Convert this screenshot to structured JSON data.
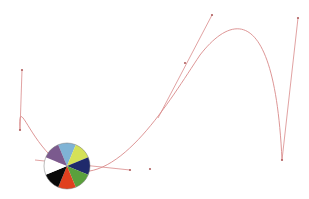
{
  "canvas": {
    "width": 309,
    "height": 199,
    "background": "#ffffff"
  },
  "curve": {
    "color": "#d98a8a",
    "path": "M 20 130 C 18 90, 30 150, 70 170 C 120 185, 170 100, 200 55 C 235 10, 275 10, 282 160",
    "handles": [
      {
        "x1": 22,
        "y1": 70,
        "x2": 20,
        "y2": 130
      },
      {
        "x1": 35,
        "y1": 160,
        "x2": 130,
        "y2": 170
      },
      {
        "x1": 158,
        "y1": 118,
        "x2": 212,
        "y2": 15
      },
      {
        "x1": 282,
        "y1": 160,
        "x2": 298,
        "y2": 18
      }
    ],
    "points": [
      {
        "x": 22,
        "y": 70
      },
      {
        "x": 20,
        "y": 130
      },
      {
        "x": 130,
        "y": 170
      },
      {
        "x": 212,
        "y": 15
      },
      {
        "x": 185,
        "y": 63
      },
      {
        "x": 282,
        "y": 160
      },
      {
        "x": 298,
        "y": 18
      },
      {
        "x": 150,
        "y": 169
      }
    ]
  },
  "color_wheel": {
    "cx": 67,
    "cy": 166,
    "r": 23,
    "slices": [
      {
        "name": "light-blue",
        "color": "#7fb3d5"
      },
      {
        "name": "yellow-green",
        "color": "#d4e157"
      },
      {
        "name": "navy",
        "color": "#1f2a6b"
      },
      {
        "name": "green",
        "color": "#5aa03c"
      },
      {
        "name": "red-orange",
        "color": "#e0401e"
      },
      {
        "name": "black",
        "color": "#0a0a0a"
      },
      {
        "name": "white",
        "color": "#ffffff"
      },
      {
        "name": "purple",
        "color": "#7b5a8e"
      }
    ]
  }
}
